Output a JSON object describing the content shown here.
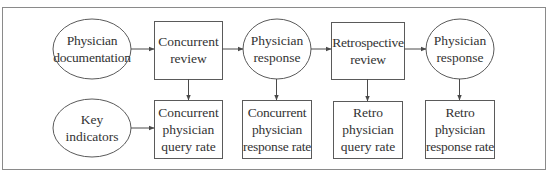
{
  "diagram": {
    "style": {
      "stroke_color": "#5a5a5a",
      "frame_color": "#8a8a8a",
      "text_color": "#333333",
      "background": "#ffffff"
    },
    "nodes": [
      {
        "id": "physician-documentation",
        "shape": "ellipse",
        "label": "Physician\ndocumentation",
        "row": 1,
        "col": 1
      },
      {
        "id": "concurrent-review",
        "shape": "rect",
        "label": "Concurrent\nreview",
        "row": 1,
        "col": 2
      },
      {
        "id": "physician-response-1",
        "shape": "ellipse",
        "label": "Physician\nresponse",
        "row": 1,
        "col": 3
      },
      {
        "id": "retrospective-review",
        "shape": "rect",
        "label": "Retrospective\nreview",
        "row": 1,
        "col": 4
      },
      {
        "id": "physician-response-2",
        "shape": "ellipse",
        "label": "Physician\nresponse",
        "row": 1,
        "col": 5
      },
      {
        "id": "key-indicators",
        "shape": "ellipse",
        "label": "Key\nindicators",
        "row": 2,
        "col": 1
      },
      {
        "id": "concurrent-physician-query-rate",
        "shape": "rect",
        "label": "Concurrent\nphysician\nquery rate",
        "row": 2,
        "col": 2
      },
      {
        "id": "concurrent-physician-response-rate",
        "shape": "rect",
        "label": "Concurrent\nphysician\nresponse rate",
        "row": 2,
        "col": 3
      },
      {
        "id": "retro-physician-query-rate",
        "shape": "rect",
        "label": "Retro\nphysician\nquery rate",
        "row": 2,
        "col": 4
      },
      {
        "id": "retro-physician-response-rate",
        "shape": "rect",
        "label": "Retro\nphysician\nresponse rate",
        "row": 2,
        "col": 5
      }
    ],
    "edges": [
      {
        "from": "physician-documentation",
        "to": "concurrent-review"
      },
      {
        "from": "concurrent-review",
        "to": "physician-response-1"
      },
      {
        "from": "physician-response-1",
        "to": "retrospective-review"
      },
      {
        "from": "retrospective-review",
        "to": "physician-response-2"
      },
      {
        "from": "key-indicators",
        "to": "concurrent-physician-query-rate"
      },
      {
        "from": "concurrent-review",
        "to": "concurrent-physician-query-rate"
      },
      {
        "from": "physician-response-1",
        "to": "concurrent-physician-response-rate"
      },
      {
        "from": "retrospective-review",
        "to": "retro-physician-query-rate"
      },
      {
        "from": "physician-response-2",
        "to": "retro-physician-response-rate"
      }
    ]
  }
}
